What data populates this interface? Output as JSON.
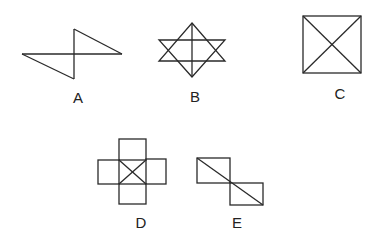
{
  "figures": [
    {
      "id": "A",
      "label": "A",
      "description": "Two triangles joined at a vertical line crossing a horizontal line (Z/bowtie shape)"
    },
    {
      "id": "B",
      "label": "B",
      "description": "Six-pointed star with a vertical line through its center"
    },
    {
      "id": "C",
      "label": "C",
      "description": "Square with both diagonals"
    },
    {
      "id": "D",
      "label": "D",
      "description": "Cross of four squares around a central square with both diagonals"
    },
    {
      "id": "E",
      "label": "E",
      "description": "Two rectangles offset diagonally, joined by a single diagonal line"
    }
  ],
  "colors": {
    "stroke": "#2a2a2a",
    "background": "#ffffff",
    "text": "#222222"
  }
}
